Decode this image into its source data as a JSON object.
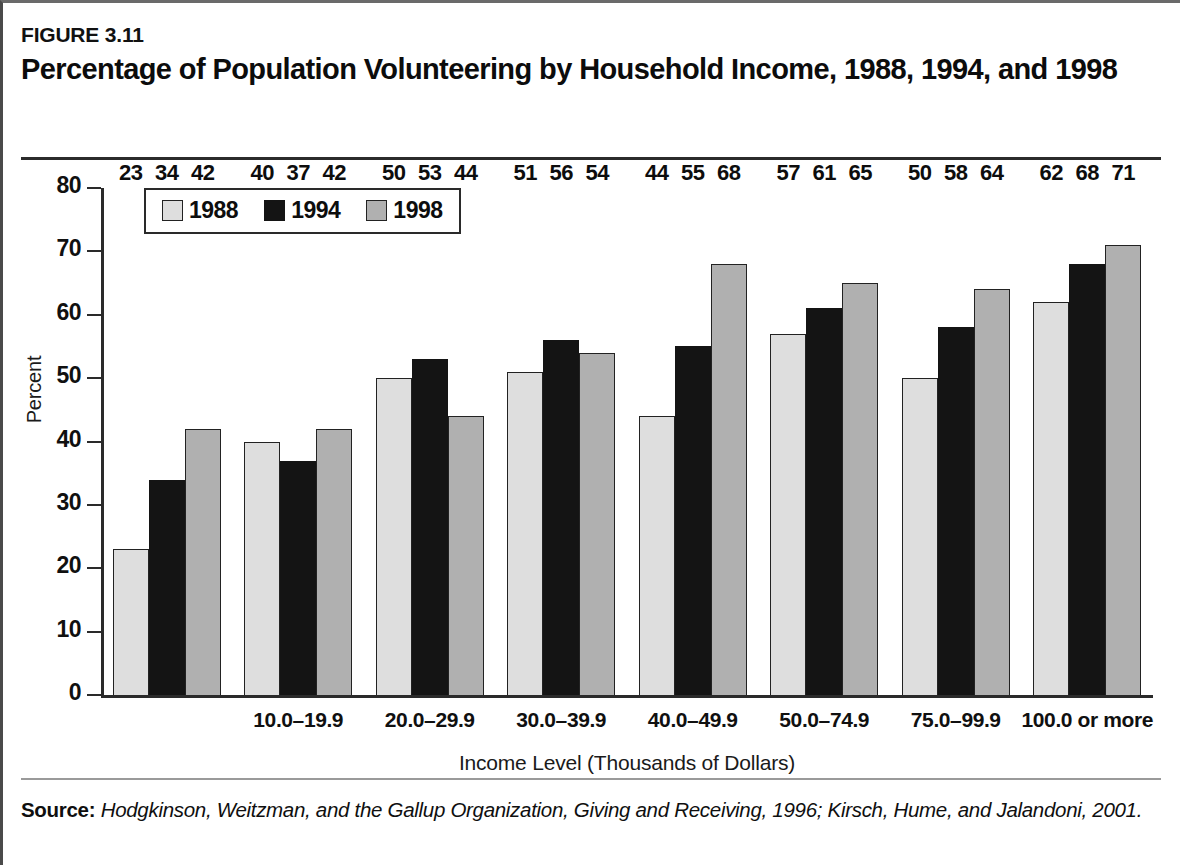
{
  "figure": {
    "number": "FIGURE 3.11",
    "title": "Percentage of Population Volunteering by Household Income, 1988, 1994, and 1998"
  },
  "source": {
    "label": "Source:",
    "text": "Hodgkinson, Weitzman, and the Gallup Organization, Giving and Receiving, 1996; Kirsch, Hume, and Jalandoni, 2001."
  },
  "legend": {
    "position": "top-left-inside",
    "items": [
      {
        "label": "1988",
        "color": "#dedede"
      },
      {
        "label": "1994",
        "color": "#141414"
      },
      {
        "label": "1998",
        "color": "#b0b0b0"
      }
    ]
  },
  "chart_data": {
    "type": "bar",
    "title": "Percentage of Population Volunteering by Household Income, 1988, 1994, and 1998",
    "xlabel": "Income Level (Thousands of Dollars)",
    "ylabel": "Percent",
    "ylim": [
      0,
      80
    ],
    "yticks": [
      0,
      10,
      20,
      30,
      40,
      50,
      60,
      70,
      80
    ],
    "ytick_labels": [
      "0",
      "10",
      "20",
      "30",
      "40",
      "50",
      "60",
      "70",
      "80"
    ],
    "grid": false,
    "legend_position": "upper left",
    "categories": [
      "",
      "10.0–19.9",
      "20.0–29.9",
      "30.0–39.9",
      "40.0–49.9",
      "50.0–74.9",
      "75.0–99.9",
      "100.0 or more"
    ],
    "series": [
      {
        "name": "1988",
        "color": "#dedede",
        "values": [
          23,
          40,
          50,
          51,
          44,
          57,
          50,
          62
        ]
      },
      {
        "name": "1994",
        "color": "#141414",
        "values": [
          34,
          37,
          53,
          56,
          55,
          61,
          58,
          68
        ]
      },
      {
        "name": "1998",
        "color": "#b0b0b0",
        "values": [
          42,
          42,
          44,
          54,
          68,
          65,
          64,
          71
        ]
      }
    ]
  }
}
